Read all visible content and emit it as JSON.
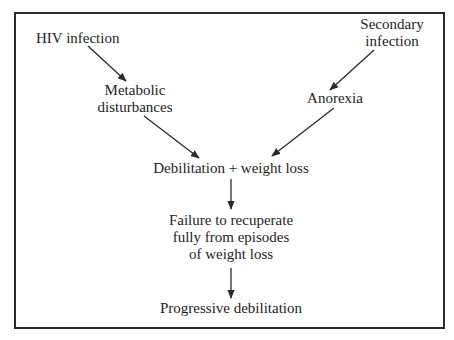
{
  "diagram": {
    "type": "flowchart",
    "nodes": {
      "hiv_infection": "HIV infection",
      "secondary_infection_line1": "Secondary",
      "secondary_infection_line2": "infection",
      "metabolic_line1": "Metabolic",
      "metabolic_line2": "disturbances",
      "anorexia": "Anorexia",
      "debilitation_weight_loss": "Debilitation + weight loss",
      "failure_line1": "Failure to recuperate",
      "failure_line2": "fully from episodes",
      "failure_line3": "of weight loss",
      "progressive_debilitation": "Progressive debilitation"
    },
    "edges": [
      {
        "from": "HIV infection",
        "to": "Metabolic disturbances"
      },
      {
        "from": "Metabolic disturbances",
        "to": "Debilitation + weight loss"
      },
      {
        "from": "Secondary infection",
        "to": "Anorexia"
      },
      {
        "from": "Anorexia",
        "to": "Debilitation + weight loss"
      },
      {
        "from": "Debilitation + weight loss",
        "to": "Failure to recuperate fully from episodes of weight loss"
      },
      {
        "from": "Failure to recuperate fully from episodes of weight loss",
        "to": "Progressive debilitation"
      }
    ],
    "colors": {
      "line": "#2a2a2a",
      "text": "#1e1e1e",
      "background": "#ffffff"
    }
  }
}
